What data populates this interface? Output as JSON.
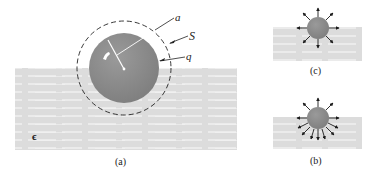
{
  "figure": {
    "colors": {
      "dielectric": "#dcdcdc",
      "dielectric_stripes": "#f4f4f4",
      "sphere": "#8c8c8c",
      "highlight": "#ffffff",
      "lines": "#222222"
    },
    "panels": [
      {
        "id": "a",
        "caption": "(a)",
        "labels": {
          "radius": "a",
          "surface": "S",
          "charge": "q",
          "permittivity": "ϵ"
        }
      },
      {
        "id": "c",
        "caption": "(c)",
        "field_lines": "uniform radial (8 arrows)"
      },
      {
        "id": "b",
        "caption": "(b)",
        "field_lines": "radial, denser in dielectric (11 arrows)"
      }
    ]
  }
}
